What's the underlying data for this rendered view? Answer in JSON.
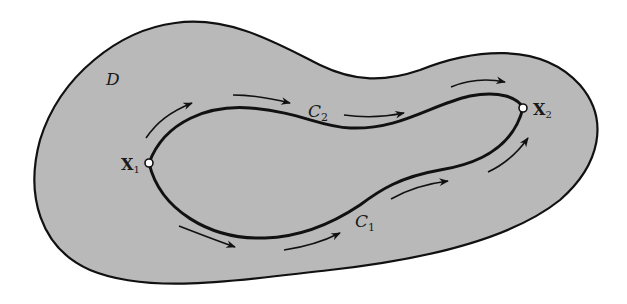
{
  "figure": {
    "region_label": "D",
    "curve_upper_label": "C",
    "curve_upper_sub": "2",
    "curve_lower_label": "C",
    "curve_lower_sub": "1",
    "point_start_label": "X",
    "point_start_sub": "1",
    "point_end_label": "X",
    "point_end_sub": "2"
  },
  "colors": {
    "region_fill": "#b9b9b9",
    "stroke": "#111111",
    "background": "#ffffff",
    "point_fill": "#ffffff"
  }
}
